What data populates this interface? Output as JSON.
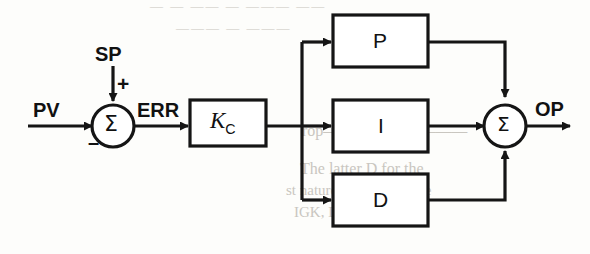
{
  "figure": {
    "type": "block-diagram",
    "background_color": "#fdfdfb",
    "line_color": "#151515"
  },
  "signals": {
    "pv": "PV",
    "sp": "SP",
    "err": "ERR",
    "op": "OP"
  },
  "summers": {
    "left": {
      "glyph": "Σ",
      "plus_sign": "+",
      "minus_sign": "–",
      "inputs": [
        "PV",
        "SP"
      ],
      "output": "ERR"
    },
    "right": {
      "glyph": "Σ",
      "inputs": [
        "P",
        "I",
        "D"
      ],
      "output": "OP"
    }
  },
  "blocks": {
    "gain": {
      "label": "K",
      "subscript": "C"
    },
    "proportional": {
      "label": "P"
    },
    "integral": {
      "label": "I"
    },
    "derivative": {
      "label": "D"
    }
  },
  "ghost_text": {
    "top": "— —  ——  — ———  ——",
    "line1": "———  —  ———",
    "line2": "rop—————————",
    "line3": "The latter D for the",
    "line4": "st nature to approximate",
    "line5": "IGK, DOF or EGA"
  }
}
